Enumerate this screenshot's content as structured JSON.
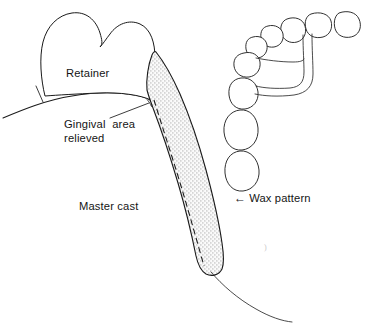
{
  "figure": {
    "type": "line-drawing",
    "background_color": "#ffffff",
    "line_color": "#1a1a1a",
    "stipple_fill_color": "#d8d8d8"
  },
  "labels": {
    "retainer": "Retainer",
    "gingival_line1": "Gingival  area",
    "gingival_line2": "relieved",
    "master_cast": "Master cast",
    "wax_pattern": "Wax pattern",
    "wax_arrow": "←"
  },
  "parts": {
    "retainer_crown": {
      "name": "Retainer",
      "description": "Premolar crown with two cusps seated on the ridge"
    },
    "master_cast": {
      "name": "Master cast",
      "description": "Curved residual ridge surface of the stone cast"
    },
    "gingival_relief": {
      "name": "Gingival area relieved",
      "description": "Small notch of relief at the gingival margin beneath the retainer"
    },
    "wax_pattern": {
      "name": "Wax pattern",
      "description": "Stippled tapering band running from the retainer down across the cast with a dashed centerline and a sprue tail"
    },
    "dental_arch": {
      "name": "Dental arch diagram",
      "description": "Occlusal view of the arch showing teeth outlines and the major connector bar",
      "tooth_count": 9
    }
  },
  "artifacts": {
    "speck": ")"
  }
}
